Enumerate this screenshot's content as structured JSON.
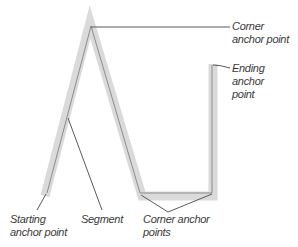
{
  "diagram": {
    "colors": {
      "highlight": "#d9d9d9",
      "path": "#8a8a8a",
      "leader": "#555555",
      "text": "#3a3a3a",
      "background": "#ffffff"
    },
    "labels": {
      "corner_top": {
        "line1": "Corner",
        "line2": "anchor point"
      },
      "ending": {
        "line1": "Ending",
        "line2": "anchor",
        "line3": "point"
      },
      "starting": {
        "line1": "Starting",
        "line2": "anchor point"
      },
      "segment": {
        "line1": "Segment"
      },
      "corner_bottom": {
        "line1": "Corner anchor",
        "line2": "points"
      }
    }
  }
}
